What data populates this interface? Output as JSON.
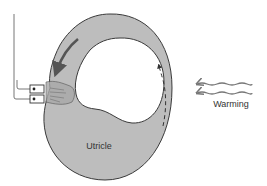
{
  "diagram": {
    "labels": {
      "utricle": "Utricle",
      "warming": "Warming"
    },
    "colors": {
      "canal_fill": "#bdbdbd",
      "outline": "#3a3a3a",
      "arrow": "#555555",
      "wavy_arrow": "#777777",
      "background": "#ffffff"
    },
    "elements": [
      {
        "name": "semicircular-canal",
        "shape": "ring"
      },
      {
        "name": "endolymph-flow-arrow",
        "style": "solid",
        "direction": "down-left"
      },
      {
        "name": "convection-arrow",
        "style": "dashed",
        "direction": "up"
      },
      {
        "name": "warming-arrows",
        "count": 2,
        "direction": "left"
      },
      {
        "name": "electrode",
        "count": 2
      }
    ]
  }
}
